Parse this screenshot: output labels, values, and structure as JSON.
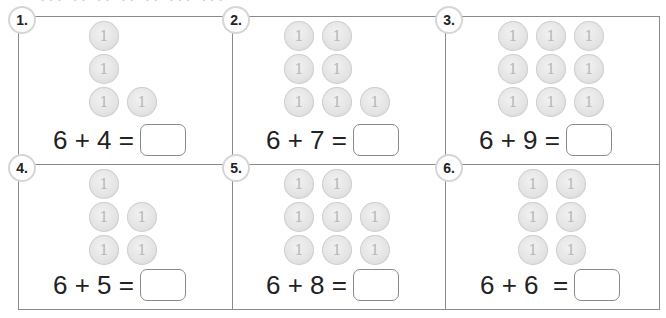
{
  "header_cutoff_text": "··· ·· ·· ·· ·· ··· ···",
  "problems": [
    {
      "number": "1.",
      "coin_rows": [
        1,
        1,
        2
      ],
      "coin_label": "1",
      "expression": "6 + 4 =",
      "answer": ""
    },
    {
      "number": "2.",
      "coin_rows": [
        2,
        2,
        3
      ],
      "coin_label": "1",
      "expression": "6 + 7 =",
      "answer": ""
    },
    {
      "number": "3.",
      "coin_rows": [
        3,
        3,
        3
      ],
      "coin_label": "1",
      "expression": "6 + 9 =",
      "answer": ""
    },
    {
      "number": "4.",
      "coin_rows": [
        1,
        2,
        2
      ],
      "coin_label": "1",
      "expression": "6 + 5 =",
      "answer": ""
    },
    {
      "number": "5.",
      "coin_rows": [
        2,
        3,
        3
      ],
      "coin_label": "1",
      "expression": "6 + 8 =",
      "answer": ""
    },
    {
      "number": "6.",
      "coin_rows": [
        2,
        2,
        2
      ],
      "coin_label": "1",
      "expression": "6 + 6  =",
      "answer": ""
    }
  ],
  "colors": {
    "border": "#8a8a8a",
    "coin": "#e3e3e3",
    "badge_ring": "#d6d6d6",
    "text": "#222222"
  }
}
